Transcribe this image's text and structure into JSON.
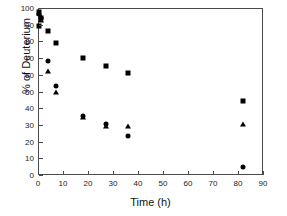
{
  "chart_data": {
    "type": "scatter",
    "title": "",
    "xlabel": "Time (h)",
    "ylabel": "% of Deuterium",
    "xlim": [
      0,
      90
    ],
    "ylim": [
      0,
      100
    ],
    "xticks": [
      0,
      10,
      20,
      30,
      40,
      50,
      60,
      70,
      80,
      90
    ],
    "yticks": [
      0,
      10,
      20,
      30,
      40,
      50,
      60,
      70,
      80,
      90,
      100
    ],
    "grid": false,
    "legend": "none",
    "marker_color": "#000000",
    "series": [
      {
        "name": "squares",
        "marker": "square",
        "points": [
          {
            "x": 0.2,
            "y": 97.5
          },
          {
            "x": 0.5,
            "y": 89.5
          },
          {
            "x": 1.2,
            "y": 94.0
          },
          {
            "x": 4.0,
            "y": 86.0
          },
          {
            "x": 7.0,
            "y": 79.0
          },
          {
            "x": 17.8,
            "y": 70.0
          },
          {
            "x": 27.0,
            "y": 65.0
          },
          {
            "x": 36.0,
            "y": 61.3
          },
          {
            "x": 82.0,
            "y": 44.5
          }
        ]
      },
      {
        "name": "circles",
        "marker": "circle",
        "points": [
          {
            "x": 0.2,
            "y": 96.5
          },
          {
            "x": 1.2,
            "y": 94.0
          },
          {
            "x": 4.0,
            "y": 68.0
          },
          {
            "x": 7.0,
            "y": 53.0
          },
          {
            "x": 17.8,
            "y": 35.6
          },
          {
            "x": 27.0,
            "y": 30.8
          },
          {
            "x": 36.0,
            "y": 23.2
          },
          {
            "x": 82.0,
            "y": 4.6
          }
        ]
      },
      {
        "name": "triangles",
        "marker": "triangle",
        "points": [
          {
            "x": 0.3,
            "y": 97.0
          },
          {
            "x": 1.0,
            "y": 93.0
          },
          {
            "x": 4.0,
            "y": 62.5
          },
          {
            "x": 7.0,
            "y": 49.5
          },
          {
            "x": 17.8,
            "y": 34.8
          },
          {
            "x": 27.0,
            "y": 29.5
          },
          {
            "x": 36.0,
            "y": 29.4
          },
          {
            "x": 82.0,
            "y": 30.6
          }
        ]
      }
    ]
  }
}
